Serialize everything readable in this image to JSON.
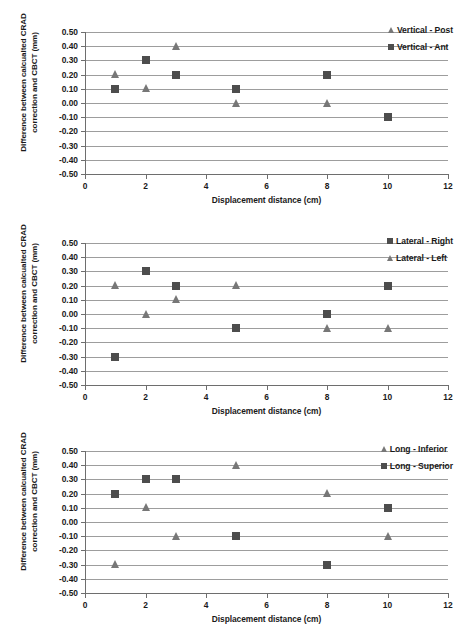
{
  "figure": {
    "axis": {
      "ylabel": "Difference between calcualted CRAD correction and CBCT (mm)",
      "xlabel": "Displacement distance (cm)",
      "yticks": [
        "0.50",
        "0.40",
        "0.30",
        "0.20",
        "0.10",
        "0.00",
        "-0.10",
        "-0.20",
        "-0.30",
        "-0.40",
        "-0.50"
      ],
      "xticks": [
        "0",
        "2",
        "4",
        "6",
        "8",
        "10",
        "12"
      ]
    },
    "colors": {
      "square_marker": "#4d4d4d",
      "triangle_marker": "#777777",
      "gridline": "#9d9d9d",
      "axis": "#6e6e6e",
      "background": "#ffffff",
      "text": "#1a1a1a"
    }
  },
  "chart_data": [
    {
      "type": "scatter",
      "title": "",
      "xlabel": "Displacement distance (cm)",
      "ylabel": "Difference between calcualted CRAD correction and CBCT (mm)",
      "xlim": [
        0,
        12
      ],
      "ylim": [
        -0.5,
        0.5
      ],
      "xtick_step": 2,
      "ytick_step": 0.1,
      "grid": "horizontal",
      "legend_position": "top-right",
      "x": [
        1,
        2,
        3,
        5,
        8,
        10
      ],
      "series": [
        {
          "name": "Vertical - Post",
          "marker": "triangle",
          "color": "#777777",
          "x": [
            1,
            2,
            3,
            5,
            8
          ],
          "values": [
            0.2,
            0.1,
            0.4,
            0.0,
            0.0
          ]
        },
        {
          "name": "Vertical - Ant",
          "marker": "square",
          "color": "#4d4d4d",
          "x": [
            1,
            2,
            3,
            5,
            8,
            10
          ],
          "values": [
            0.1,
            0.3,
            0.2,
            0.1,
            0.2,
            -0.1
          ]
        }
      ]
    },
    {
      "type": "scatter",
      "title": "",
      "xlabel": "Displacement distance (cm)",
      "ylabel": "Difference between calcualted CRAD correction and CBCT (mm)",
      "xlim": [
        0,
        12
      ],
      "ylim": [
        -0.5,
        0.5
      ],
      "xtick_step": 2,
      "ytick_step": 0.1,
      "grid": "horizontal",
      "legend_position": "top-right",
      "x": [
        1,
        2,
        3,
        5,
        8,
        10
      ],
      "series": [
        {
          "name": "Lateral - Right",
          "marker": "square",
          "color": "#4d4d4d",
          "x": [
            1,
            2,
            3,
            5,
            8,
            10
          ],
          "values": [
            -0.3,
            0.3,
            0.2,
            -0.1,
            0.0,
            0.2
          ]
        },
        {
          "name": "Lateral - Left",
          "marker": "triangle",
          "color": "#777777",
          "x": [
            1,
            2,
            3,
            5,
            8,
            10
          ],
          "values": [
            0.2,
            0.0,
            0.1,
            0.2,
            -0.1,
            -0.1
          ]
        }
      ]
    },
    {
      "type": "scatter",
      "title": "",
      "xlabel": "Displacement distance (cm)",
      "ylabel": "Difference between calcualted CRAD correction and CBCT (mm)",
      "xlim": [
        0,
        12
      ],
      "ylim": [
        -0.5,
        0.5
      ],
      "xtick_step": 2,
      "ytick_step": 0.1,
      "grid": "horizontal",
      "legend_position": "top-right",
      "x": [
        1,
        2,
        3,
        5,
        8,
        10
      ],
      "series": [
        {
          "name": "Long - Inferior",
          "marker": "triangle",
          "color": "#777777",
          "x": [
            1,
            2,
            3,
            5,
            8,
            10
          ],
          "values": [
            -0.3,
            0.1,
            -0.1,
            0.4,
            0.2,
            -0.1
          ]
        },
        {
          "name": "Long - Superior",
          "marker": "square",
          "color": "#4d4d4d",
          "x": [
            1,
            2,
            3,
            5,
            8,
            10
          ],
          "values": [
            0.2,
            0.3,
            0.3,
            -0.1,
            -0.3,
            0.1
          ]
        }
      ]
    }
  ]
}
